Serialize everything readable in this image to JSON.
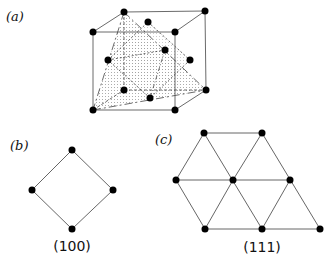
{
  "panels": {
    "a": {
      "label": "(a)",
      "description": "FCC unit cell with (100) and (111) planes"
    },
    "b": {
      "label": "(b)",
      "caption": "(100)"
    },
    "c": {
      "label": "(c)",
      "caption": "(111)"
    }
  },
  "colors": {
    "node": "#000000",
    "line": "#555555",
    "plane_fill": "#bbbbbb"
  }
}
